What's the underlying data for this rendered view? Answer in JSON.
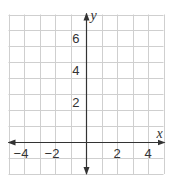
{
  "chart_data": {
    "type": "scatter",
    "title": "",
    "xlabel": "x",
    "ylabel": "y",
    "xlim": [
      -5,
      5
    ],
    "ylim": [
      -2,
      8
    ],
    "grid": true,
    "grid_step": 1,
    "x_ticks": [
      {
        "value": -4,
        "label": "−4"
      },
      {
        "value": -2,
        "label": "−2"
      },
      {
        "value": 2,
        "label": "2"
      },
      {
        "value": 4,
        "label": "4"
      }
    ],
    "y_ticks": [
      {
        "value": 2,
        "label": "2"
      },
      {
        "value": 4,
        "label": "4"
      },
      {
        "value": 6,
        "label": "6"
      }
    ],
    "series": [],
    "axis_arrows": {
      "x": "both",
      "y": "both"
    },
    "colors": {
      "grid": "#cfcfcf",
      "axis": "#333333",
      "text": "#333333"
    }
  }
}
